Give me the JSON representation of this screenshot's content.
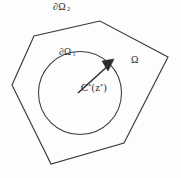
{
  "figure": {
    "name": "domain-boundary-diagram",
    "background_color": "#fdfdfd",
    "stroke_color": "#3a3a3a",
    "text_color": "#2b2b2b"
  },
  "labels": {
    "outer_boundary": {
      "symbol": "∂",
      "letter": "Ω",
      "subscript": "2",
      "full": "∂Ω₂",
      "description": "outer-polygon-boundary-label"
    },
    "inner_boundary": {
      "symbol": "∂",
      "letter": "Ω",
      "subscript": "1",
      "full": "∂Ω₁",
      "description": "inner-circle-boundary-label"
    },
    "domain": {
      "letter": "Ω",
      "full": "Ω",
      "description": "domain-region-label"
    },
    "radius": {
      "base": "C",
      "base_superscript": "*",
      "open_paren": "(",
      "arg": "z",
      "arg_superscript": "*",
      "close_paren": ")",
      "full": "C*(z*)",
      "description": "radius-arrow-label"
    }
  },
  "geometry": {
    "outer_polygon": {
      "shape": "hexagon",
      "points": "100,21 34,36 12,85 51,164 124,143 168,57"
    },
    "inner_circle": {
      "cx": 80,
      "cy": 93,
      "r": 41.5
    },
    "radius_arrow": {
      "x1": 78,
      "y1": 93,
      "x2": 110,
      "y2": 64,
      "head_points": "113,60 103,62 108,70"
    }
  }
}
